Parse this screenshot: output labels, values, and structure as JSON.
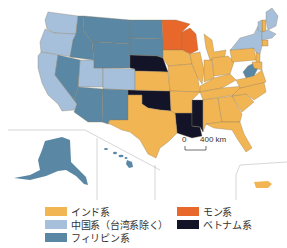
{
  "map": {
    "title": "",
    "categories": [
      {
        "id": "indian",
        "label": "インド系",
        "color": "#f2b553"
      },
      {
        "id": "chinese",
        "label": "中国系（台湾系除く）",
        "color": "#a6c0dc"
      },
      {
        "id": "filipino",
        "label": "フィリピン系",
        "color": "#5a87a3"
      },
      {
        "id": "hmong",
        "label": "モン系",
        "color": "#e8672b"
      },
      {
        "id": "vietnamese",
        "label": "ベトナム系",
        "color": "#131428"
      }
    ],
    "scale_bar": {
      "zero": "0",
      "distance": "400 km"
    },
    "regions": {
      "chinese": [
        "Washington",
        "Oregon",
        "California",
        "Utah",
        "Colorado",
        "New York",
        "Vermont",
        "New Hampshire",
        "Maine",
        "Massachusetts",
        "Rhode Island"
      ],
      "filipino": [
        "Idaho",
        "Montana",
        "Nevada",
        "Wyoming",
        "Arizona",
        "New Mexico",
        "North Dakota",
        "South Dakota",
        "Alaska",
        "Hawaii",
        "West Virginia"
      ],
      "hmong": [
        "Minnesota",
        "Wisconsin"
      ],
      "vietnamese": [
        "Nebraska",
        "Oklahoma",
        "Louisiana",
        "Mississippi"
      ],
      "indian": [
        "Texas",
        "Kansas",
        "Iowa",
        "Missouri",
        "Arkansas",
        "Illinois",
        "Indiana",
        "Michigan",
        "Ohio",
        "Kentucky",
        "Tennessee",
        "Alabama",
        "Georgia",
        "Florida",
        "South Carolina",
        "North Carolina",
        "Virginia",
        "Pennsylvania",
        "New Jersey",
        "Delaware",
        "Maryland",
        "Connecticut",
        "Puerto Rico"
      ]
    }
  },
  "legend": {
    "items": [
      {
        "label": "インド系",
        "color": "#f2b553"
      },
      {
        "label": "中国系（台湾系除く）",
        "color": "#a6c0dc"
      },
      {
        "label": "フィリピン系",
        "color": "#5a87a3"
      },
      {
        "label": "モン系",
        "color": "#e8672b"
      },
      {
        "label": "ベトナム系",
        "color": "#131428"
      }
    ]
  }
}
